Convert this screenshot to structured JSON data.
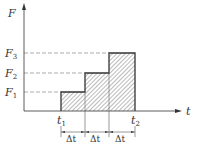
{
  "diagram": {
    "axes": {
      "y_label": "F",
      "x_label": "t"
    },
    "levels": [
      {
        "name": "F",
        "sub": "1"
      },
      {
        "name": "F",
        "sub": "2"
      },
      {
        "name": "F",
        "sub": "3"
      }
    ],
    "time_marks": [
      {
        "name": "t",
        "sub": "1"
      },
      {
        "name": "t",
        "sub": "2"
      }
    ],
    "intervals": [
      "Δt",
      "Δt",
      "Δt"
    ],
    "colors": {
      "line": "#333333",
      "dash": "#888888",
      "hatch": "#666666"
    }
  }
}
